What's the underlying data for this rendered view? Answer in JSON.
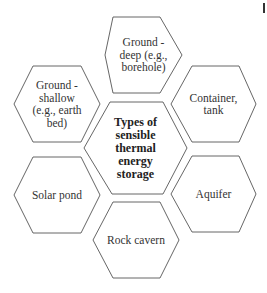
{
  "diagram": {
    "type": "hexagon-cluster",
    "center": {
      "label": "Types of sensible thermal energy storage",
      "lines": [
        "Types of",
        "sensible",
        "thermal",
        "energy",
        "storage"
      ]
    },
    "nodes": [
      {
        "id": "top",
        "position": "top",
        "lines": [
          "Ground -",
          "deep (e.g.,",
          "borehole)"
        ]
      },
      {
        "id": "upper-left",
        "position": "upper-left",
        "lines": [
          "Ground -",
          "shallow",
          "(e.g., earth",
          "bed)"
        ]
      },
      {
        "id": "upper-right",
        "position": "upper-right",
        "lines": [
          "Container,",
          "tank"
        ]
      },
      {
        "id": "lower-left",
        "position": "lower-left",
        "lines": [
          "Solar pond"
        ]
      },
      {
        "id": "lower-right",
        "position": "lower-right",
        "lines": [
          "Aquifer"
        ]
      },
      {
        "id": "bottom",
        "position": "bottom",
        "lines": [
          "Rock cavern"
        ]
      }
    ],
    "colors": {
      "stroke": "#555555",
      "fill": "#ffffff",
      "text": "#333333"
    }
  }
}
